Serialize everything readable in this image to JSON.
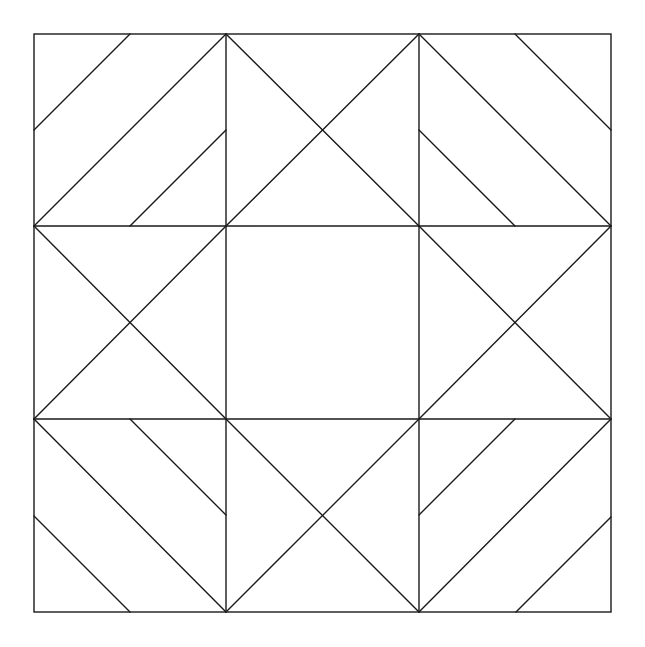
{
  "diagram": {
    "title": "",
    "type": "quilt-block",
    "width": 645,
    "height": 647,
    "stroke_color": "#1a1a1a",
    "background": "#ffffff",
    "border": {
      "x": 34,
      "y": 34,
      "w": 577,
      "h": 578
    },
    "grid": {
      "xs": [
        34,
        226,
        419,
        611
      ],
      "ys": [
        34,
        226,
        419,
        612
      ]
    },
    "cells": [
      {
        "name": "cell-top-left",
        "lines": [
          [
            130,
            34,
            34,
            130
          ],
          [
            226,
            34,
            34,
            226
          ],
          [
            226,
            130,
            130,
            226
          ]
        ]
      },
      {
        "name": "cell-top-center",
        "lines": [
          [
            226,
            34,
            419,
            226
          ],
          [
            419,
            34,
            226,
            226
          ]
        ]
      },
      {
        "name": "cell-top-right",
        "lines": [
          [
            515,
            34,
            611,
            130
          ],
          [
            419,
            34,
            611,
            226
          ],
          [
            419,
            130,
            515,
            226
          ]
        ]
      },
      {
        "name": "cell-middle-left",
        "lines": [
          [
            34,
            226,
            226,
            419
          ],
          [
            226,
            226,
            34,
            419
          ]
        ]
      },
      {
        "name": "cell-center",
        "lines": []
      },
      {
        "name": "cell-middle-right",
        "lines": [
          [
            419,
            226,
            611,
            419
          ],
          [
            611,
            226,
            419,
            419
          ]
        ]
      },
      {
        "name": "cell-bottom-left",
        "lines": [
          [
            34,
            419,
            226,
            612
          ],
          [
            130,
            419,
            226,
            515
          ],
          [
            34,
            516,
            130,
            612
          ]
        ]
      },
      {
        "name": "cell-bottom-center",
        "lines": [
          [
            226,
            419,
            419,
            612
          ],
          [
            419,
            419,
            226,
            612
          ]
        ]
      },
      {
        "name": "cell-bottom-right",
        "lines": [
          [
            515,
            419,
            419,
            515
          ],
          [
            611,
            419,
            419,
            612
          ],
          [
            611,
            517,
            516,
            612
          ]
        ]
      }
    ]
  }
}
